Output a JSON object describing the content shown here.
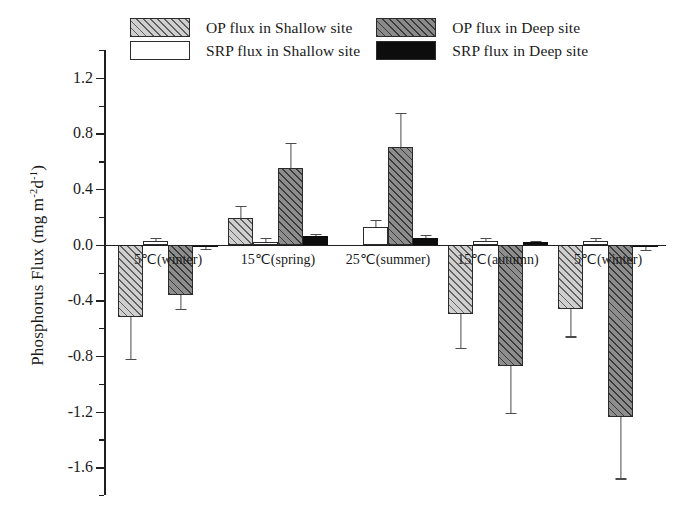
{
  "chart_data": {
    "type": "bar",
    "title": "",
    "xlabel": "",
    "ylabel": "Phosphorus Flux (mg m",
    "ylabel_sup1": "-2",
    "ylabel_mid": "d",
    "ylabel_sup2": "-1",
    "ylabel_end": ")",
    "ylabel_full": "Phosphorus Flux (mg m-2d-1)",
    "ylim": [
      -1.8,
      1.4
    ],
    "yticks": [
      1.2,
      0.8,
      0.4,
      0.0,
      -0.4,
      -0.8,
      -1.2,
      -1.6
    ],
    "ytick_labels": [
      "1.2",
      "0.8",
      "0.4",
      "0.0",
      "-0.4",
      "-0.8",
      "-1.2",
      "-1.6"
    ],
    "yminor_step": 0.2,
    "grid": false,
    "legend_position": "top",
    "categories": [
      "5℃(winter)",
      "15℃(spring)",
      "25℃(summer)",
      "15℃(autumn)",
      "5℃(winter)"
    ],
    "series": [
      {
        "name": "OP flux in Shallow site",
        "fill": "#cfcfcf",
        "pattern": "diagonal-hatch",
        "values": [
          -0.52,
          0.19,
          0.0,
          -0.5,
          -0.46
        ],
        "errors": [
          0.3,
          0.09,
          0.0,
          0.24,
          0.2
        ]
      },
      {
        "name": "SRP flux in Shallow site",
        "fill": "#ffffff",
        "pattern": "solid",
        "values": [
          0.03,
          0.02,
          0.13,
          0.03,
          0.03
        ],
        "errors": [
          0.02,
          0.03,
          0.05,
          0.02,
          0.02
        ]
      },
      {
        "name": "OP flux in Deep site",
        "fill": "#8d8d8d",
        "pattern": "diagonal-hatch",
        "values": [
          -0.36,
          0.55,
          0.7,
          -0.87,
          -1.24
        ],
        "errors": [
          0.1,
          0.18,
          0.25,
          0.34,
          0.44
        ]
      },
      {
        "name": "SRP flux in Deep site",
        "fill": "#0d0d0d",
        "pattern": "solid",
        "values": [
          -0.02,
          0.06,
          0.05,
          0.02,
          -0.02
        ],
        "errors": [
          0.01,
          0.02,
          0.02,
          0.01,
          0.02
        ]
      }
    ]
  },
  "legend": {
    "entries": [
      {
        "label": "OP flux in Shallow site",
        "swatch": "op-shallow-swatch"
      },
      {
        "label": "OP flux in Deep site",
        "swatch": "op-deep-swatch"
      },
      {
        "label": "SRP flux in Shallow site",
        "swatch": "srp-shallow-swatch"
      },
      {
        "label": "SRP flux in Deep site",
        "swatch": "srp-deep-swatch"
      }
    ]
  }
}
